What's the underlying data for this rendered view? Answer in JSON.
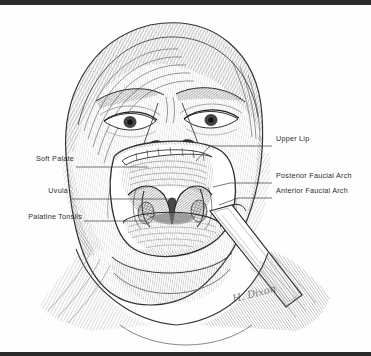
{
  "figure": {
    "medium": "pen-and-ink crosshatch drawing",
    "signature": "H. Dixon"
  },
  "labels": {
    "left": [
      {
        "id": "soft-palate",
        "text": "Soft Palate",
        "x": 16,
        "y": 158,
        "leader_to_x": 148,
        "leader_y": 162
      },
      {
        "id": "uvula",
        "text": "Uvula",
        "x": 44,
        "y": 190,
        "leader_to_x": 176,
        "leader_y": 194
      },
      {
        "id": "palatine-tonsils",
        "text": "Palatine Tonsils",
        "x": 16,
        "y": 216,
        "leader_to_x": 156,
        "leader_y": 209
      }
    ],
    "right": [
      {
        "id": "upper-lip",
        "text": "Upper Lip",
        "x": 276,
        "y": 138,
        "leader_to_x": 196,
        "leader_y": 156
      },
      {
        "id": "posterior-faucial-arch",
        "text": "Posterior Faucial Arch",
        "x": 276,
        "y": 175,
        "leader_to_x": 213,
        "leader_y": 180
      },
      {
        "id": "anterior-faucial-arch",
        "text": "Anterior Faucial Arch",
        "x": 276,
        "y": 190,
        "leader_to_x": 219,
        "leader_y": 199
      }
    ]
  },
  "colors": {
    "ink": "#2c2c2c",
    "rule": "#2a2a2a",
    "paper": "#fefefe",
    "hatch_light": "#8f8f8f",
    "hatch_mid": "#5e5e5e",
    "hatch_dark": "#303030"
  },
  "anatomy_parts": [
    "Upper Lip",
    "Soft Palate",
    "Uvula",
    "Palatine Tonsils",
    "Anterior Faucial Arch",
    "Posterior Faucial Arch",
    "Tongue",
    "Tongue depressor"
  ]
}
